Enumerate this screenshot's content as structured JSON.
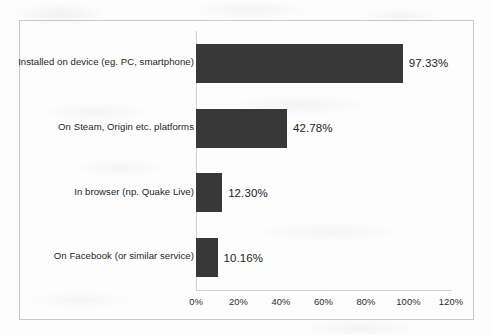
{
  "chart_data": {
    "type": "bar",
    "orientation": "horizontal",
    "title": "",
    "subtitle": "",
    "xlabel": "",
    "ylabel": "",
    "categories": [
      "Installed on device (eg. PC, smartphone)",
      "On Steam, Origin etc. platforms",
      "In browser (np. Quake Live)",
      "On Facebook (or similar service)"
    ],
    "values": [
      97.33,
      42.78,
      12.3,
      10.16
    ],
    "value_labels": [
      "97.33%",
      "42.78%",
      "12.30%",
      "10.16%"
    ],
    "xlim": [
      0,
      120
    ],
    "xticks": [
      0,
      20,
      40,
      60,
      80,
      100,
      120
    ],
    "xtick_labels": [
      "0%",
      "20%",
      "40%",
      "60%",
      "80%",
      "100%",
      "120%"
    ],
    "grid": false,
    "legend": false,
    "legend_position": "none",
    "bar_color": "#383838",
    "axis_color": "#d0d0d0",
    "frame_color": "#c9c9c9",
    "text_color": "#262626",
    "background_color": "#fdfdfd"
  }
}
